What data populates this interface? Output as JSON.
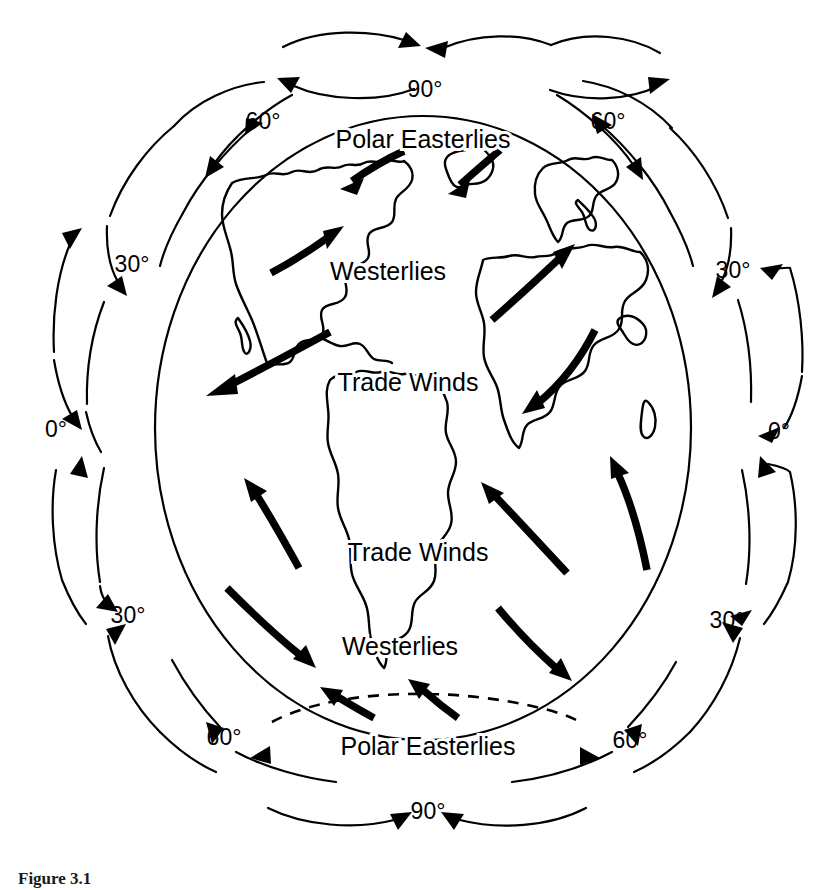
{
  "figure": {
    "caption": "Figure 3.1",
    "background_color": "#ffffff",
    "line_color": "#000000"
  },
  "globe": {
    "center_x": 423,
    "center_y": 428,
    "radius_x": 268,
    "radius_y": 312
  },
  "wind_belt_labels": [
    {
      "id": "polar-easterlies-north",
      "text": "Polar Easterlies",
      "x": 423,
      "y": 139,
      "hemisphere": "north"
    },
    {
      "id": "westerlies-north",
      "text": "Westerlies",
      "x": 388,
      "y": 271,
      "hemisphere": "north"
    },
    {
      "id": "trade-winds-north",
      "text": "Trade Winds",
      "x": 408,
      "y": 382,
      "hemisphere": "north"
    },
    {
      "id": "trade-winds-south",
      "text": "Trade Winds",
      "x": 418,
      "y": 552,
      "hemisphere": "south"
    },
    {
      "id": "westerlies-south",
      "text": "Westerlies",
      "x": 400,
      "y": 646,
      "hemisphere": "south"
    },
    {
      "id": "polar-easterlies-south",
      "text": "Polar Easterlies",
      "x": 428,
      "y": 746,
      "hemisphere": "south"
    }
  ],
  "latitude_labels": [
    {
      "id": "lat-90-north",
      "text": "90°",
      "x": 425,
      "y": 97,
      "side": "top"
    },
    {
      "id": "lat-60-north-left",
      "text": "60°",
      "x": 263,
      "y": 129,
      "side": "upper-left"
    },
    {
      "id": "lat-60-north-right",
      "text": "60°",
      "x": 608,
      "y": 129,
      "side": "upper-right"
    },
    {
      "id": "lat-30-north-left",
      "text": "30°",
      "x": 132,
      "y": 264,
      "side": "left"
    },
    {
      "id": "lat-30-north-right",
      "text": "30°",
      "x": 728,
      "y": 270,
      "side": "right"
    },
    {
      "id": "lat-0-left",
      "text": "0°",
      "x": 56,
      "y": 428,
      "side": "left"
    },
    {
      "id": "lat-0-right",
      "text": "0°",
      "x": 775,
      "y": 430,
      "side": "right"
    },
    {
      "id": "lat-30-south-left",
      "text": "30°",
      "x": 125,
      "y": 615,
      "side": "left"
    },
    {
      "id": "lat-30-south-right",
      "text": "30°",
      "x": 724,
      "y": 620,
      "side": "right"
    },
    {
      "id": "lat-60-south-left",
      "text": "60°",
      "x": 222,
      "y": 738,
      "side": "lower-left"
    },
    {
      "id": "lat-60-south-right",
      "text": "60°",
      "x": 628,
      "y": 741,
      "side": "lower-right"
    },
    {
      "id": "lat-90-south",
      "text": "90°",
      "x": 428,
      "y": 811,
      "side": "bottom"
    }
  ],
  "circulation_cells": [
    {
      "id": "cell-hadley-north-left",
      "name": "Hadley cell",
      "position": "left",
      "band": "0-30N"
    },
    {
      "id": "cell-ferrel-north-left",
      "name": "Ferrel cell",
      "position": "left",
      "band": "30-60N"
    },
    {
      "id": "cell-polar-north-left",
      "name": "Polar cell",
      "position": "left",
      "band": "60-90N"
    },
    {
      "id": "cell-polar-north-right",
      "name": "Polar cell",
      "position": "right",
      "band": "60-90N"
    },
    {
      "id": "cell-ferrel-north-right",
      "name": "Ferrel cell",
      "position": "right",
      "band": "30-60N"
    },
    {
      "id": "cell-hadley-north-right",
      "name": "Hadley cell",
      "position": "right",
      "band": "0-30N"
    },
    {
      "id": "cell-hadley-south-left",
      "name": "Hadley cell",
      "position": "left",
      "band": "0-30S"
    },
    {
      "id": "cell-ferrel-south-left",
      "name": "Ferrel cell",
      "position": "left",
      "band": "30-60S"
    },
    {
      "id": "cell-polar-south-left",
      "name": "Polar cell",
      "position": "left",
      "band": "60-90S"
    },
    {
      "id": "cell-polar-south-right",
      "name": "Polar cell",
      "position": "right",
      "band": "60-90S"
    },
    {
      "id": "cell-ferrel-south-right",
      "name": "Ferrel cell",
      "position": "right",
      "band": "30-60S"
    },
    {
      "id": "cell-hadley-south-right",
      "name": "Hadley cell",
      "position": "right",
      "band": "0-30S"
    }
  ],
  "surface_wind_arrows": [
    {
      "id": "arrow-polar-easterly-nw",
      "belt": "Polar Easterlies",
      "hemisphere": "north",
      "direction": "southwest"
    },
    {
      "id": "arrow-polar-easterly-ne",
      "belt": "Polar Easterlies",
      "hemisphere": "north",
      "direction": "southwest"
    },
    {
      "id": "arrow-westerly-n-left",
      "belt": "Westerlies",
      "hemisphere": "north",
      "direction": "northeast"
    },
    {
      "id": "arrow-westerly-n-right",
      "belt": "Westerlies",
      "hemisphere": "north",
      "direction": "northeast"
    },
    {
      "id": "arrow-trade-n-left",
      "belt": "Trade Winds",
      "hemisphere": "north",
      "direction": "southwest"
    },
    {
      "id": "arrow-trade-n-right",
      "belt": "Trade Winds",
      "hemisphere": "north",
      "direction": "southwest"
    },
    {
      "id": "arrow-trade-s-left",
      "belt": "Trade Winds",
      "hemisphere": "south",
      "direction": "northwest"
    },
    {
      "id": "arrow-trade-s-mid",
      "belt": "Trade Winds",
      "hemisphere": "south",
      "direction": "northwest"
    },
    {
      "id": "arrow-trade-s-right",
      "belt": "Trade Winds",
      "hemisphere": "south",
      "direction": "northwest"
    },
    {
      "id": "arrow-westerly-s-left",
      "belt": "Westerlies",
      "hemisphere": "south",
      "direction": "southeast"
    },
    {
      "id": "arrow-westerly-s-right",
      "belt": "Westerlies",
      "hemisphere": "south",
      "direction": "southeast"
    },
    {
      "id": "arrow-polar-easterly-sw",
      "belt": "Polar Easterlies",
      "hemisphere": "south",
      "direction": "northwest"
    },
    {
      "id": "arrow-polar-easterly-se",
      "belt": "Polar Easterlies",
      "hemisphere": "south",
      "direction": "northwest"
    }
  ],
  "landmasses": [
    {
      "id": "north-america",
      "name": "North America"
    },
    {
      "id": "greenland",
      "name": "Greenland"
    },
    {
      "id": "south-america",
      "name": "South America"
    },
    {
      "id": "europe",
      "name": "Europe"
    },
    {
      "id": "africa",
      "name": "Africa"
    },
    {
      "id": "antarctic-front",
      "name": "Antarctic polar front"
    }
  ]
}
